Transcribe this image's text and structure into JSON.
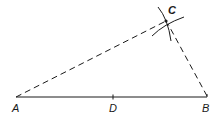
{
  "diagram": {
    "type": "geometric-construction",
    "points": {
      "A": {
        "label": "A",
        "x": 16,
        "y": 97
      },
      "B": {
        "label": "B",
        "x": 207,
        "y": 97
      },
      "C": {
        "label": "C",
        "x": 166,
        "y": 21
      },
      "D": {
        "label": "D",
        "x": 113,
        "y": 97
      }
    },
    "segments": [
      {
        "from": "A",
        "to": "B",
        "style": "solid"
      },
      {
        "from": "A",
        "to": "C",
        "style": "dashed"
      },
      {
        "from": "B",
        "to": "C",
        "style": "dashed"
      }
    ],
    "arcs": [
      {
        "center": "A",
        "through": "C",
        "note": "arc centered at A"
      },
      {
        "center": "B",
        "through": "C",
        "note": "arc centered at B"
      }
    ],
    "colors": {
      "stroke": "#1a1a1a",
      "background": "#ffffff"
    }
  }
}
